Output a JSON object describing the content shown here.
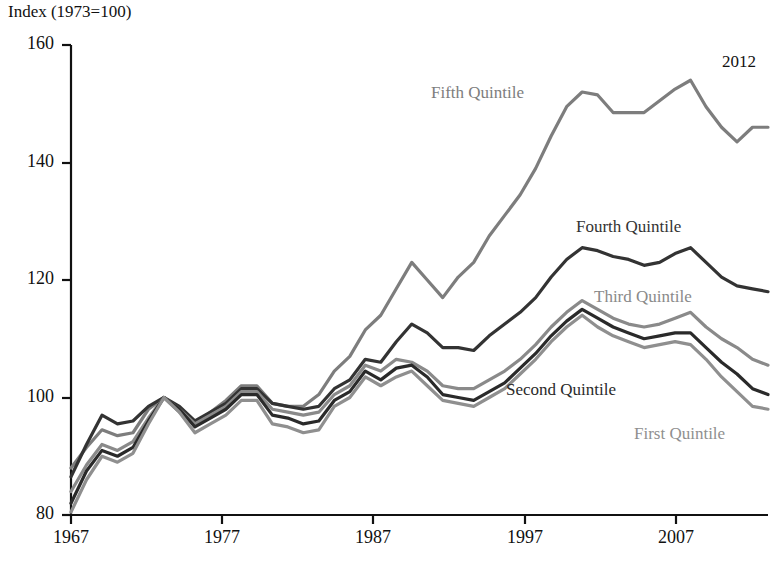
{
  "chart_data": {
    "type": "line",
    "title": "",
    "ylabel": "Index (1973=100)",
    "xlabel": "",
    "xlim": [
      1967,
      2012
    ],
    "ylim": [
      80,
      160
    ],
    "grid": false,
    "legend_position": "inline-annotations",
    "x_ticks": [
      "1967",
      "1977",
      "1987",
      "1997",
      "2007"
    ],
    "y_ticks": [
      "80",
      "100",
      "120",
      "140",
      "160"
    ],
    "end_year_annotation": "2012",
    "x": [
      1967,
      1968,
      1969,
      1970,
      1971,
      1972,
      1973,
      1974,
      1975,
      1976,
      1977,
      1978,
      1979,
      1980,
      1981,
      1982,
      1983,
      1984,
      1985,
      1986,
      1987,
      1988,
      1989,
      1990,
      1991,
      1992,
      1993,
      1994,
      1995,
      1996,
      1997,
      1998,
      1999,
      2000,
      2001,
      2002,
      2003,
      2004,
      2005,
      2006,
      2007,
      2008,
      2009,
      2010,
      2011,
      2012
    ],
    "series": [
      {
        "name": "Fifth Quintile",
        "color": "#7d7d7d",
        "label_x": 431,
        "label_y": 83,
        "values": [
          88.0,
          91.5,
          94.5,
          93.5,
          94.0,
          98.0,
          100.0,
          97.5,
          95.5,
          97.5,
          99.5,
          102.0,
          102.0,
          99.0,
          98.5,
          98.5,
          100.5,
          104.5,
          107.0,
          111.5,
          114.0,
          118.5,
          123.0,
          120.0,
          117.0,
          120.5,
          123.0,
          127.5,
          131.0,
          134.5,
          139.0,
          144.5,
          149.5,
          152.0,
          151.5,
          148.5,
          148.5,
          148.5,
          150.5,
          152.5,
          154.0,
          149.5,
          146.0,
          143.5,
          146.0,
          146.0
        ]
      },
      {
        "name": "Fourth Quintile",
        "color": "#333333",
        "label_x": 576,
        "label_y": 217,
        "values": [
          86.5,
          92.0,
          97.0,
          95.5,
          96.0,
          98.5,
          100.0,
          98.5,
          96.0,
          97.5,
          99.0,
          101.5,
          101.5,
          99.0,
          98.5,
          98.0,
          98.5,
          101.5,
          103.0,
          106.5,
          106.0,
          109.5,
          112.5,
          111.0,
          108.5,
          108.5,
          108.0,
          110.5,
          112.5,
          114.5,
          117.0,
          120.5,
          123.5,
          125.5,
          125.0,
          124.0,
          123.5,
          122.5,
          123.0,
          124.5,
          125.5,
          123.0,
          120.5,
          119.0,
          118.5,
          118.0
        ]
      },
      {
        "name": "Third Quintile",
        "color": "#8a8a8a",
        "label_x": 594,
        "label_y": 287,
        "values": [
          84.0,
          88.5,
          92.0,
          91.0,
          92.5,
          96.5,
          100.0,
          98.0,
          95.5,
          97.0,
          98.5,
          101.0,
          101.0,
          98.0,
          97.5,
          97.0,
          97.5,
          100.5,
          102.0,
          105.5,
          104.5,
          106.5,
          106.0,
          104.5,
          102.0,
          101.5,
          101.5,
          103.0,
          104.5,
          106.5,
          109.0,
          112.0,
          114.5,
          116.5,
          115.0,
          113.5,
          112.5,
          112.0,
          112.5,
          113.5,
          114.5,
          112.0,
          110.0,
          108.5,
          106.5,
          105.5
        ]
      },
      {
        "name": "Second Quintile",
        "color": "#2a2a2a",
        "label_x": 506,
        "label_y": 380,
        "values": [
          82.0,
          87.5,
          91.0,
          90.0,
          91.5,
          96.0,
          100.0,
          98.0,
          95.0,
          96.5,
          98.0,
          100.5,
          100.5,
          97.0,
          96.5,
          95.5,
          96.0,
          99.5,
          101.0,
          104.5,
          103.0,
          105.0,
          105.5,
          103.5,
          100.5,
          100.0,
          99.5,
          101.0,
          102.5,
          105.0,
          107.5,
          110.5,
          113.0,
          115.0,
          113.5,
          112.0,
          111.0,
          110.0,
          110.5,
          111.0,
          111.0,
          108.5,
          106.0,
          104.0,
          101.5,
          100.5
        ]
      },
      {
        "name": "First Quintile",
        "color": "#8f8f8f",
        "label_x": 634,
        "label_y": 424,
        "values": [
          80.5,
          86.0,
          90.0,
          89.0,
          90.5,
          95.5,
          100.0,
          97.5,
          94.0,
          95.5,
          97.0,
          99.5,
          99.5,
          95.5,
          95.0,
          94.0,
          94.5,
          98.5,
          100.0,
          103.5,
          102.0,
          103.5,
          104.5,
          102.0,
          99.5,
          99.0,
          98.5,
          100.0,
          101.5,
          104.0,
          106.5,
          109.5,
          112.0,
          114.0,
          112.0,
          110.5,
          109.5,
          108.5,
          109.0,
          109.5,
          109.0,
          106.5,
          103.5,
          101.0,
          98.5,
          98.0
        ]
      }
    ]
  },
  "axes": {
    "y_axis_title": "Index (1973=100)",
    "x_tick_labels": [
      {
        "text": "1967",
        "x": 71
      },
      {
        "text": "1977",
        "x": 222
      },
      {
        "text": "1987",
        "x": 373
      },
      {
        "text": "1997",
        "x": 525
      },
      {
        "text": "2007",
        "x": 676
      }
    ],
    "y_tick_labels": [
      {
        "text": "160",
        "y": 45
      },
      {
        "text": "140",
        "y": 163
      },
      {
        "text": "120",
        "y": 280
      },
      {
        "text": "100",
        "y": 398
      },
      {
        "text": "80",
        "y": 515
      }
    ]
  },
  "annotations": {
    "end_year": {
      "text": "2012",
      "x": 722,
      "y": 52
    }
  }
}
